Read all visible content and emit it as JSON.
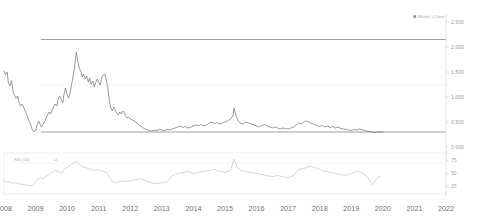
{
  "legend": {
    "marker": "square-marker",
    "series_name": "Market",
    "separator": "|",
    "series_field": "Close"
  },
  "main_panel": {
    "y_axis": {
      "ticks": [
        "2.500",
        "2.000",
        "1.500",
        "1.000",
        "0.500",
        "0.000"
      ],
      "tick_values": [
        2.5,
        2.0,
        1.5,
        1.0,
        0.5,
        0.0
      ],
      "position": "right"
    },
    "reference_lines": [
      {
        "name": "resistance-line",
        "style": "solid",
        "value": 2.15
      },
      {
        "name": "midline",
        "style": "dotted",
        "value": 1.24
      },
      {
        "name": "support-line",
        "style": "solid",
        "value": 0.3
      }
    ]
  },
  "indicator_panel": {
    "label": "RSI (14)",
    "period_value": "14",
    "y_axis": {
      "ticks": [
        "75",
        "50",
        "25"
      ],
      "tick_values": [
        75,
        50,
        25
      ],
      "position": "right"
    }
  },
  "x_axis": {
    "ticks": [
      "2008",
      "2009",
      "2010",
      "2011",
      "2012",
      "2013",
      "2014",
      "2015",
      "2016",
      "2017",
      "2018",
      "2019",
      "2020",
      "2021",
      "2022"
    ],
    "min": 2008,
    "max": 2022
  },
  "colors": {
    "series": "#7a7a7a",
    "indicator": "#c2c2c2",
    "reference_solid": "#8e8e8e",
    "reference_dotted": "#c9c9c9",
    "axis": "#d2d2d2",
    "tick_text": "#6f6f6f",
    "background": "#ffffff"
  },
  "chart_data": {
    "type": "line",
    "title": "",
    "subtitle": "",
    "xlabel": "",
    "ylabel": "",
    "xlim": [
      2008,
      2022
    ],
    "ylim": [
      0.0,
      2.5
    ],
    "grid": false,
    "legend_position": "top-right",
    "annotations": [
      {
        "type": "hline",
        "label": "resistance",
        "y": 2.15,
        "style": "solid"
      },
      {
        "type": "hline",
        "label": "midline",
        "y": 1.24,
        "style": "dotted"
      },
      {
        "type": "hline",
        "label": "support",
        "y": 0.3,
        "style": "solid"
      }
    ],
    "series": [
      {
        "name": "Market Close",
        "axis": "main",
        "x": [
          2008.0,
          2008.05,
          2008.1,
          2008.14,
          2008.19,
          2008.24,
          2008.29,
          2008.33,
          2008.38,
          2008.43,
          2008.48,
          2008.52,
          2008.57,
          2008.62,
          2008.67,
          2008.71,
          2008.76,
          2008.81,
          2008.86,
          2008.9,
          2008.95,
          2009.0,
          2009.05,
          2009.1,
          2009.14,
          2009.19,
          2009.24,
          2009.29,
          2009.33,
          2009.38,
          2009.43,
          2009.48,
          2009.52,
          2009.57,
          2009.62,
          2009.67,
          2009.71,
          2009.76,
          2009.81,
          2009.86,
          2009.9,
          2009.95,
          2010.0,
          2010.05,
          2010.1,
          2010.14,
          2010.19,
          2010.24,
          2010.29,
          2010.33,
          2010.38,
          2010.43,
          2010.48,
          2010.52,
          2010.57,
          2010.62,
          2010.67,
          2010.71,
          2010.76,
          2010.81,
          2010.86,
          2010.9,
          2010.95,
          2011.0,
          2011.05,
          2011.1,
          2011.14,
          2011.19,
          2011.24,
          2011.29,
          2011.33,
          2011.38,
          2011.43,
          2011.48,
          2011.52,
          2011.57,
          2011.62,
          2011.67,
          2011.71,
          2011.76,
          2011.81,
          2011.86,
          2011.9,
          2011.95,
          2012.0,
          2012.08,
          2012.17,
          2012.25,
          2012.33,
          2012.42,
          2012.5,
          2012.58,
          2012.67,
          2012.75,
          2012.83,
          2012.92,
          2013.0,
          2013.08,
          2013.17,
          2013.25,
          2013.33,
          2013.42,
          2013.5,
          2013.58,
          2013.67,
          2013.75,
          2013.83,
          2013.92,
          2014.0,
          2014.08,
          2014.17,
          2014.25,
          2014.33,
          2014.42,
          2014.5,
          2014.58,
          2014.67,
          2014.75,
          2014.83,
          2014.92,
          2015.0,
          2015.08,
          2015.17,
          2015.25,
          2015.29,
          2015.33,
          2015.38,
          2015.42,
          2015.5,
          2015.58,
          2015.67,
          2015.75,
          2015.83,
          2015.92,
          2016.0,
          2016.08,
          2016.17,
          2016.25,
          2016.33,
          2016.42,
          2016.5,
          2016.58,
          2016.67,
          2016.75,
          2016.83,
          2016.92,
          2017.0,
          2017.08,
          2017.17,
          2017.25,
          2017.33,
          2017.42,
          2017.5,
          2017.58,
          2017.67,
          2017.75,
          2017.83,
          2017.92,
          2018.0,
          2018.08,
          2018.17,
          2018.25,
          2018.33,
          2018.42,
          2018.5,
          2018.58,
          2018.67,
          2018.75,
          2018.83,
          2018.92,
          2019.0,
          2019.08,
          2019.17,
          2019.25,
          2019.33,
          2019.42,
          2019.5,
          2019.58,
          2019.67,
          2019.75,
          2019.83,
          2019.92,
          2020.0
        ],
        "y": [
          1.52,
          1.45,
          1.5,
          1.28,
          1.22,
          1.33,
          1.1,
          1.04,
          0.97,
          1.02,
          0.88,
          0.82,
          0.86,
          0.8,
          0.72,
          0.66,
          0.58,
          0.5,
          0.42,
          0.34,
          0.3,
          0.33,
          0.44,
          0.52,
          0.46,
          0.4,
          0.45,
          0.52,
          0.58,
          0.64,
          0.7,
          0.66,
          0.74,
          0.8,
          0.86,
          0.82,
          0.94,
          1.02,
          0.96,
          0.88,
          1.05,
          1.18,
          1.04,
          0.98,
          1.1,
          1.24,
          1.42,
          1.62,
          1.9,
          1.74,
          1.58,
          1.52,
          1.4,
          1.46,
          1.36,
          1.42,
          1.3,
          1.38,
          1.26,
          1.32,
          1.2,
          1.28,
          1.36,
          1.3,
          1.24,
          1.4,
          1.44,
          1.46,
          1.34,
          1.18,
          0.95,
          0.78,
          0.72,
          0.8,
          0.74,
          0.68,
          0.64,
          0.7,
          0.66,
          0.72,
          0.68,
          0.62,
          0.58,
          0.6,
          0.56,
          0.54,
          0.5,
          0.46,
          0.42,
          0.38,
          0.35,
          0.33,
          0.32,
          0.34,
          0.33,
          0.35,
          0.34,
          0.33,
          0.35,
          0.34,
          0.36,
          0.38,
          0.4,
          0.42,
          0.39,
          0.41,
          0.38,
          0.4,
          0.42,
          0.44,
          0.43,
          0.45,
          0.42,
          0.44,
          0.48,
          0.5,
          0.47,
          0.49,
          0.46,
          0.48,
          0.5,
          0.52,
          0.56,
          0.62,
          0.78,
          0.66,
          0.58,
          0.52,
          0.48,
          0.46,
          0.5,
          0.48,
          0.46,
          0.44,
          0.42,
          0.4,
          0.43,
          0.45,
          0.42,
          0.4,
          0.38,
          0.4,
          0.38,
          0.36,
          0.38,
          0.37,
          0.36,
          0.38,
          0.4,
          0.44,
          0.48,
          0.46,
          0.5,
          0.52,
          0.49,
          0.47,
          0.45,
          0.43,
          0.41,
          0.43,
          0.4,
          0.42,
          0.39,
          0.41,
          0.38,
          0.4,
          0.37,
          0.36,
          0.35,
          0.34,
          0.33,
          0.35,
          0.34,
          0.36,
          0.35,
          0.33,
          0.32,
          0.31,
          0.3,
          0.29,
          0.3,
          0.3,
          0.3
        ]
      },
      {
        "name": "RSI (14)",
        "axis": "indicator",
        "x": [
          2008.0,
          2008.1,
          2008.19,
          2008.29,
          2008.38,
          2008.48,
          2008.57,
          2008.67,
          2008.76,
          2008.86,
          2008.95,
          2009.05,
          2009.14,
          2009.24,
          2009.33,
          2009.43,
          2009.52,
          2009.62,
          2009.71,
          2009.81,
          2009.9,
          2010.0,
          2010.1,
          2010.19,
          2010.29,
          2010.38,
          2010.48,
          2010.57,
          2010.67,
          2010.76,
          2010.86,
          2010.95,
          2011.05,
          2011.14,
          2011.24,
          2011.33,
          2011.43,
          2011.52,
          2011.62,
          2011.71,
          2011.81,
          2011.9,
          2012.0,
          2012.17,
          2012.33,
          2012.5,
          2012.67,
          2012.83,
          2013.0,
          2013.17,
          2013.33,
          2013.5,
          2013.67,
          2013.83,
          2014.0,
          2014.17,
          2014.33,
          2014.5,
          2014.67,
          2014.83,
          2015.0,
          2015.17,
          2015.29,
          2015.38,
          2015.5,
          2015.67,
          2015.83,
          2016.0,
          2016.17,
          2016.33,
          2016.5,
          2016.67,
          2016.83,
          2017.0,
          2017.17,
          2017.33,
          2017.5,
          2017.67,
          2017.83,
          2018.0,
          2018.17,
          2018.33,
          2018.5,
          2018.67,
          2018.83,
          2019.0,
          2019.17,
          2019.33,
          2019.5,
          2019.67,
          2019.83,
          2019.92
        ],
        "y": [
          36,
          34,
          33,
          31,
          32,
          30,
          29,
          28,
          27,
          26,
          28,
          38,
          42,
          40,
          44,
          48,
          52,
          56,
          54,
          50,
          58,
          62,
          66,
          70,
          74,
          68,
          64,
          62,
          60,
          58,
          56,
          58,
          56,
          54,
          52,
          44,
          34,
          32,
          34,
          36,
          35,
          34,
          36,
          38,
          40,
          36,
          32,
          30,
          32,
          34,
          46,
          50,
          52,
          54,
          50,
          52,
          54,
          56,
          58,
          54,
          52,
          56,
          78,
          62,
          56,
          54,
          52,
          50,
          48,
          46,
          44,
          46,
          44,
          42,
          46,
          58,
          60,
          64,
          62,
          58,
          54,
          52,
          50,
          48,
          46,
          50,
          54,
          52,
          44,
          28,
          42,
          44
        ]
      }
    ]
  }
}
